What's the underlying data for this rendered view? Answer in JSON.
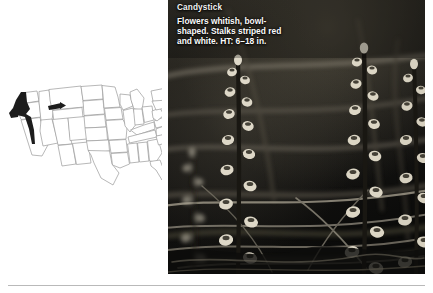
{
  "page": {
    "background_color": "#ffffff",
    "rule_color": "#b9b9b9"
  },
  "plant": {
    "common_name": "Candystick",
    "description_lines": [
      "Flowers whitish, bowl-",
      "shaped. Stalks striped red",
      "and white. HT: 6–18 in."
    ],
    "description_full": "Flowers whitish, bowl-shaped. Stalks striped red and white. HT: 6–18 in.",
    "flower_color": "whitish",
    "flower_shape": "bowl-shaped",
    "stalk_pattern": "striped red and white",
    "height_label": "HT: 6–18 in.",
    "height_min_in": 6,
    "height_max_in": 18,
    "title_color": "#f2f2f2",
    "caption_color": "#fbfbfb"
  },
  "range_map": {
    "name": "united-states-range-map",
    "region_label": "Pacific Northwest",
    "range_color": "#1c1c1c",
    "state_fill": "#ffffff",
    "state_border_color": "#9a9a9a",
    "shaded_states": [
      "Washington",
      "Oregon",
      "California",
      "Idaho",
      "Montana"
    ]
  },
  "photo": {
    "name": "candystick-plant-photo",
    "alt": "Candystick flower stalks in grayscale",
    "is_grayscale": true,
    "background_tone": "#141414"
  }
}
